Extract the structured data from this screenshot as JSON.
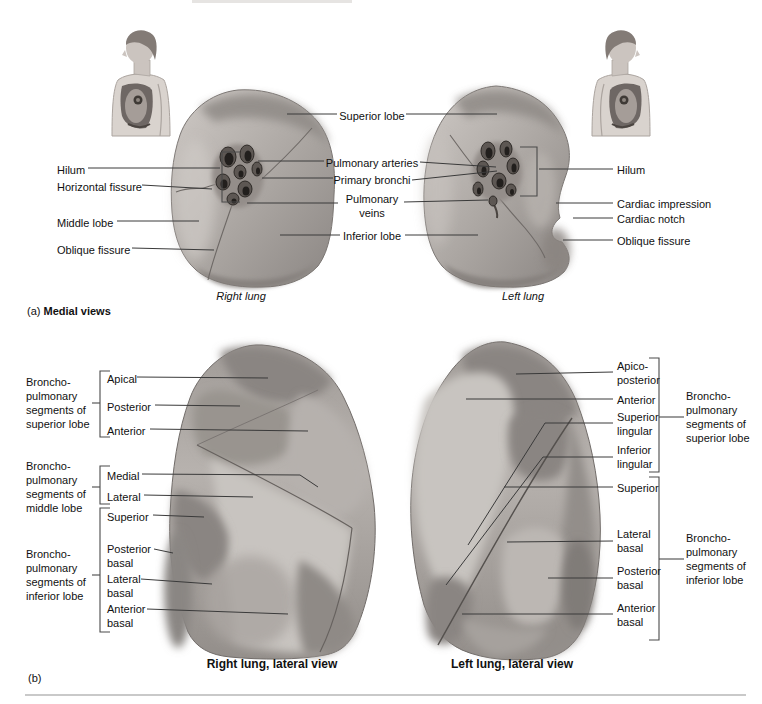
{
  "figure": {
    "panel_a": {
      "tag": "(a)",
      "caption": "Medial views",
      "right_lung_name": "Right lung",
      "left_lung_name": "Left lung",
      "left_labels": [
        "Hilum",
        "Horizontal fissure",
        "Middle lobe",
        "Oblique fissure"
      ],
      "center_labels": [
        "Superior lobe",
        "Pulmonary arteries",
        "Primary bronchi",
        "Pulmonary veins",
        "Inferior lobe"
      ],
      "right_labels": [
        "Hilum",
        "Cardiac impression",
        "Cardiac notch",
        "Oblique fissure"
      ]
    },
    "panel_b": {
      "tag": "(b)",
      "right_caption": "Right lung, lateral view",
      "left_caption": "Left lung, lateral view",
      "right_lung": {
        "groups": [
          "Broncho-pulmonary segments of superior lobe",
          "Broncho-pulmonary segments of middle lobe",
          "Broncho-pulmonary segments of inferior lobe"
        ],
        "segments": [
          "Apical",
          "Posterior",
          "Anterior",
          "Medial",
          "Lateral",
          "Superior",
          "Posterior basal",
          "Lateral basal",
          "Anterior basal"
        ]
      },
      "left_lung": {
        "groups": [
          "Broncho-pulmonary segments of superior lobe",
          "Broncho-pulmonary segments of inferior lobe"
        ],
        "segments": [
          "Apico-posterior",
          "Anterior",
          "Superior lingular",
          "Inferior lingular",
          "Superior",
          "Lateral basal",
          "Posterior basal",
          "Anterior basal"
        ]
      }
    },
    "illustrations": {
      "human_figure_left": "upper-body side profile facing left with lung shown in chest",
      "human_figure_right": "upper-body side profile facing right with lung shown in chest",
      "right_lung_medial": "right lung, medial surface with hilum vessels",
      "left_lung_medial": "left lung, medial surface with hilum vessels, cardiac impression and notch",
      "right_lung_lateral": "right lung, lateral surface with shaded bronchopulmonary segments",
      "left_lung_lateral": "left lung, lateral surface with shaded bronchopulmonary segments"
    },
    "colors": {
      "lung_base": "#aaa5a1",
      "lung_dark": "#8f8a86",
      "lung_light": "#c6c2be",
      "leader_line": "#3a3a3a",
      "text": "#111111",
      "divider": "#c9c9c9"
    }
  }
}
